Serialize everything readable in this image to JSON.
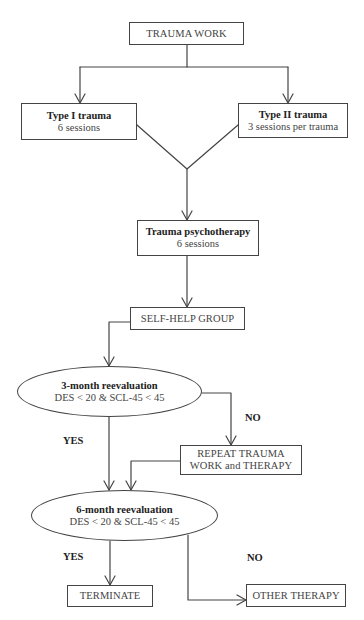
{
  "diagram": {
    "type": "flowchart",
    "line_color": "#444444",
    "nodes": {
      "trauma_work": {
        "label": "TRAUMA WORK"
      },
      "type1": {
        "title": "Type I trauma",
        "subtitle": "6 sessions"
      },
      "type2": {
        "title": "Type II trauma",
        "subtitle": "3 sessions per trauma"
      },
      "psychotherapy": {
        "title": "Trauma psychotherapy",
        "subtitle": "6 sessions"
      },
      "self_help": {
        "label": "SELF-HELP GROUP"
      },
      "reeval3": {
        "title": "3-month reevaluation",
        "subtitle": "DES < 20 & SCL-45 < 45"
      },
      "repeat": {
        "line1": "REPEAT TRAUMA",
        "line2": "WORK and THERAPY"
      },
      "reeval6": {
        "title": "6-month reevaluation",
        "subtitle": "DES < 20 & SCL-45 < 45"
      },
      "terminate": {
        "label": "TERMINATE"
      },
      "other_therapy": {
        "label": "OTHER THERAPY"
      }
    },
    "edge_labels": {
      "reeval3_yes": "YES",
      "reeval3_no": "NO",
      "reeval6_yes": "YES",
      "reeval6_no": "NO"
    },
    "edges": [
      {
        "from": "trauma_work",
        "to": "type1"
      },
      {
        "from": "trauma_work",
        "to": "type2"
      },
      {
        "from": "type1",
        "to": "psychotherapy"
      },
      {
        "from": "type2",
        "to": "psychotherapy"
      },
      {
        "from": "psychotherapy",
        "to": "self_help"
      },
      {
        "from": "self_help",
        "to": "reeval3"
      },
      {
        "from": "reeval3",
        "to": "reeval6",
        "label": "YES"
      },
      {
        "from": "reeval3",
        "to": "repeat",
        "label": "NO"
      },
      {
        "from": "repeat",
        "to": "reeval6"
      },
      {
        "from": "reeval6",
        "to": "terminate",
        "label": "YES"
      },
      {
        "from": "reeval6",
        "to": "other_therapy",
        "label": "NO"
      }
    ]
  }
}
